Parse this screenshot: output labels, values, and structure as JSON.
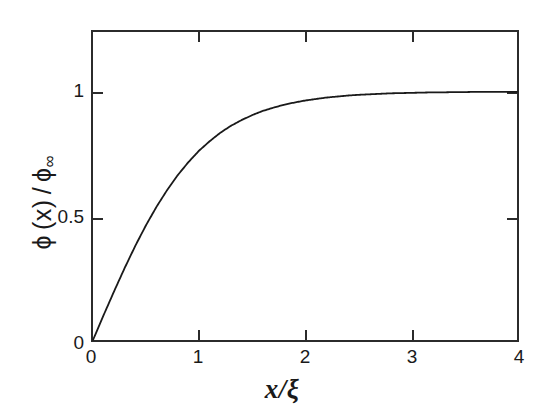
{
  "figure": {
    "background_color": "#ffffff",
    "ink_color": "#1a1a1a",
    "frame_color": "#2b2b2b"
  },
  "axes": {
    "x": {
      "label_parts": {
        "variable": "x",
        "slash": "/",
        "denominator": "ξ"
      },
      "label": "x/ξ",
      "ticks": [
        "0",
        "1",
        "2",
        "3",
        "4"
      ],
      "tick_values": [
        0,
        1,
        2,
        3,
        4
      ],
      "range": [
        0,
        4
      ],
      "mirror_ticks": true,
      "tick_direction": "in"
    },
    "y": {
      "label_parts": {
        "phi": "ϕ",
        "arg": "(x)",
        "slash": "/",
        "phi2": "ϕ",
        "sub": "∞"
      },
      "label": "ϕ (x) / ϕ∞",
      "ticks": [
        "0",
        "0.5",
        "1"
      ],
      "tick_values": [
        0,
        0.5,
        1
      ],
      "range": [
        0,
        1.24
      ],
      "mirror_ticks": true,
      "tick_direction": "in"
    }
  },
  "chart_data": {
    "type": "line",
    "title": "",
    "subtitle": "",
    "xlabel": "x/ξ",
    "ylabel": "ϕ (x) / ϕ∞",
    "xlim": [
      0,
      4
    ],
    "ylim": [
      0,
      1.24
    ],
    "xticks": [
      0,
      1,
      2,
      3,
      4
    ],
    "xticklabels": [
      "0",
      "1",
      "2",
      "3",
      "4"
    ],
    "yticks": [
      0,
      0.5,
      1
    ],
    "yticklabels": [
      "0",
      "0.5",
      "1"
    ],
    "grid": false,
    "legend": null,
    "legend_position": "none",
    "annotations": [],
    "series": [
      {
        "name": "ϕ(x)/ϕ∞ = tanh(x/ξ)",
        "formula": "tanh(x)",
        "color": "#1a1a1a",
        "linewidth": 1.8,
        "x": [
          0.0,
          0.1,
          0.2,
          0.3,
          0.4,
          0.5,
          0.6,
          0.7,
          0.8,
          0.9,
          1.0,
          1.1,
          1.2,
          1.3,
          1.4,
          1.5,
          1.6,
          1.7,
          1.8,
          1.9,
          2.0,
          2.1,
          2.2,
          2.3,
          2.4,
          2.5,
          2.6,
          2.7,
          2.8,
          2.9,
          3.0,
          3.1,
          3.2,
          3.3,
          3.4,
          3.5,
          3.6,
          3.7,
          3.8,
          3.9,
          4.0
        ],
        "y": [
          0.0,
          0.1,
          0.197,
          0.291,
          0.38,
          0.462,
          0.537,
          0.604,
          0.664,
          0.716,
          0.762,
          0.8,
          0.834,
          0.862,
          0.885,
          0.905,
          0.922,
          0.935,
          0.947,
          0.956,
          0.964,
          0.97,
          0.976,
          0.98,
          0.984,
          0.987,
          0.989,
          0.991,
          0.993,
          0.994,
          0.995,
          0.996,
          0.997,
          0.997,
          0.998,
          0.998,
          0.999,
          0.999,
          0.999,
          0.999,
          0.999
        ]
      }
    ]
  }
}
